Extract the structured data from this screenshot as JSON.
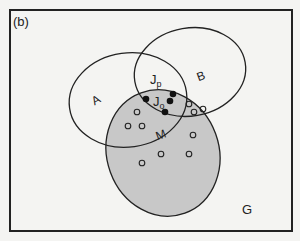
{
  "panel_label": "(b)",
  "universe_label": "G",
  "sets": {
    "A": {
      "label": "A"
    },
    "B": {
      "label": "B"
    },
    "M": {
      "label": "M",
      "fill": "#c8c8c8"
    }
  },
  "regions": {
    "Jp": {
      "label": "J",
      "sub": "p"
    },
    "Jo": {
      "label": "J",
      "sub": "o"
    }
  },
  "colors": {
    "stroke": "#222222",
    "background": "#f4f4f2",
    "frame": "#222222"
  },
  "points": {
    "filled": [
      [
        146,
        99
      ],
      [
        173,
        94
      ],
      [
        170,
        101
      ],
      [
        165,
        112
      ]
    ],
    "open": [
      [
        137,
        112
      ],
      [
        128,
        126
      ],
      [
        142,
        126
      ],
      [
        189,
        104
      ],
      [
        194,
        112
      ],
      [
        203,
        109
      ],
      [
        193,
        135
      ],
      [
        161,
        154
      ],
      [
        189,
        154
      ],
      [
        142,
        163
      ]
    ]
  }
}
